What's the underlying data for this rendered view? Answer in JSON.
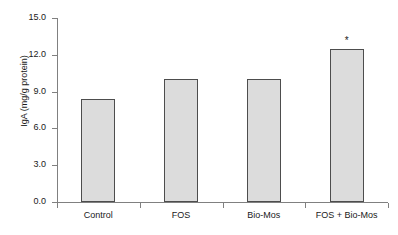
{
  "chart_data": {
    "type": "bar",
    "title": "",
    "xlabel": "",
    "ylabel": "IgA (mg/g protein)",
    "categories": [
      "Control",
      "FOS",
      "Bio-Mos",
      "FOS + Bio-Mos"
    ],
    "values": [
      8.4,
      10.0,
      10.0,
      12.5
    ],
    "ylim": [
      0.0,
      15.0
    ],
    "ytick_labels": [
      "15.0",
      "12.0",
      "9.0",
      "6.0",
      "3.0",
      "0.0"
    ],
    "ytick_values": [
      15.0,
      12.0,
      9.0,
      6.0,
      3.0,
      0.0
    ],
    "grid": false,
    "legend": "none",
    "annotations": [
      {
        "category": "FOS + Bio-Mos",
        "text": "*",
        "meaning": "significance-marker"
      }
    ],
    "bar_fill_color": "#dcdcdc",
    "bar_border_color": "#4d4d4d",
    "axis_color": "#808080",
    "background_color": "#ffffff"
  }
}
